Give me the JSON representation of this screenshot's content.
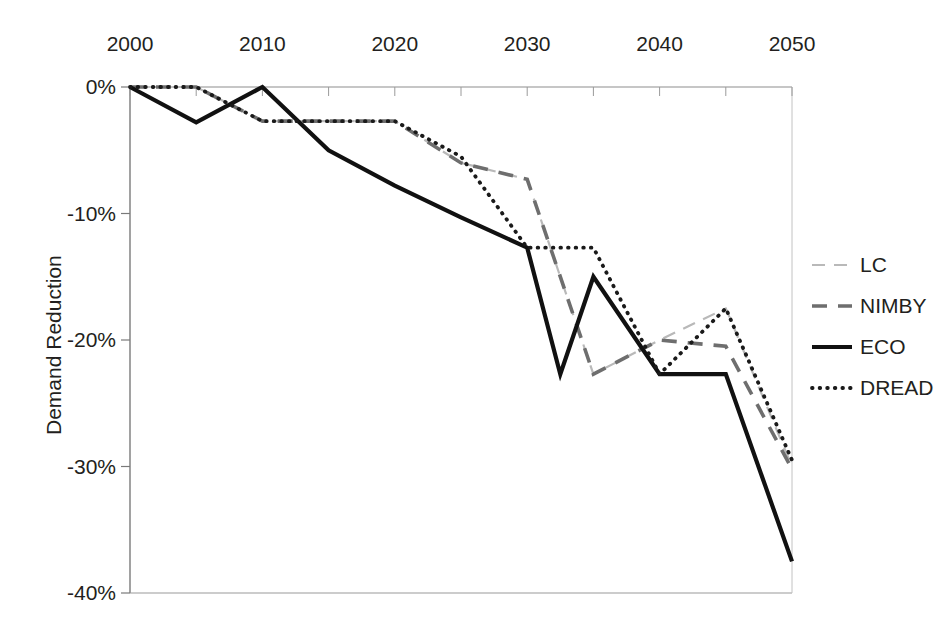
{
  "chart_data": {
    "type": "line",
    "title": "",
    "xlabel": "",
    "ylabel": "Demand Reduction",
    "x": [
      2000,
      2005,
      2010,
      2015,
      2020,
      2025,
      2030,
      2035,
      2040,
      2045,
      2050
    ],
    "xlim": [
      2000,
      2050
    ],
    "ylim": [
      -40,
      0
    ],
    "xticklabels": [
      "2000",
      "2010",
      "2020",
      "2030",
      "2040",
      "2050"
    ],
    "xtickvalues": [
      2000,
      2010,
      2020,
      2030,
      2040,
      2050
    ],
    "yticklabels": [
      "0%",
      "-10%",
      "-20%",
      "-30%",
      "-40%"
    ],
    "ytickvalues": [
      0,
      -10,
      -20,
      -30,
      -40
    ],
    "xaxis_position": "top",
    "grid": false,
    "legend_position": "right",
    "units": "percent",
    "series": [
      {
        "name": "LC",
        "style": "thin-light-gray",
        "color": "#b9b9b9",
        "values": [
          0,
          0,
          -2.7,
          -2.7,
          -2.7,
          -6.0,
          -7.3,
          -22.7,
          -20.0,
          -17.5,
          -30.0
        ]
      },
      {
        "name": "NIMBY",
        "style": "dashed-gray",
        "color": "#6e6e6e",
        "values": [
          0,
          0,
          -2.7,
          -2.7,
          -2.7,
          -6.0,
          -7.3,
          -22.7,
          -20.0,
          -20.5,
          -30.2
        ]
      },
      {
        "name": "ECO",
        "style": "solid-black",
        "color": "#111111",
        "values": [
          0,
          -2.8,
          0,
          -5.0,
          -7.8,
          -10.3,
          -12.7,
          -15.0,
          -22.7,
          -22.7,
          -37.5
        ]
      },
      {
        "name": "DREAD",
        "style": "dotted-black",
        "color": "#1a1a1a",
        "values": [
          0,
          0,
          -2.7,
          -2.7,
          -2.7,
          -5.5,
          -12.7,
          -12.7,
          -22.7,
          -17.5,
          -29.5
        ]
      }
    ],
    "eco_extra_points": [
      {
        "x": 2005,
        "y": -2.8
      },
      {
        "x": 2032.5,
        "y": -22.7
      }
    ]
  },
  "legend": {
    "entries": [
      {
        "label": "LC"
      },
      {
        "label": "NIMBY"
      },
      {
        "label": "ECO"
      },
      {
        "label": "DREAD"
      }
    ]
  },
  "axes": {
    "y_title": "Demand Reduction"
  }
}
